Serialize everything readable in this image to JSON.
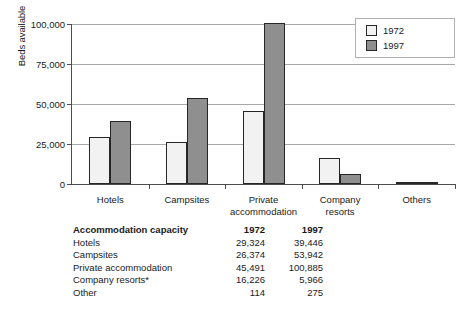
{
  "chart_data": {
    "type": "bar",
    "title": "",
    "xlabel": "",
    "ylabel": "Beds available",
    "ylim": [
      0,
      100000
    ],
    "yticks": [
      0,
      25000,
      50000,
      75000,
      100000
    ],
    "ytick_labels": [
      "0",
      "25,000",
      "50,000",
      "75,000",
      "100,000"
    ],
    "grid": true,
    "legend_position": "top-right",
    "categories": [
      "Hotels",
      "Campsites",
      "Private\naccommodation",
      "Company\nresorts",
      "Others"
    ],
    "series": [
      {
        "name": "1972",
        "color": "#f2f2f2",
        "values": [
          29324,
          26374,
          45491,
          16226,
          114
        ]
      },
      {
        "name": "1997",
        "color": "#8f8f8f",
        "values": [
          39446,
          53942,
          100885,
          5966,
          275
        ]
      }
    ]
  },
  "legend": {
    "items": [
      {
        "label": "1972"
      },
      {
        "label": "1997"
      }
    ]
  },
  "table": {
    "headers": [
      "Accommodation capacity",
      "1972",
      "1997"
    ],
    "rows": [
      {
        "label": "Hotels",
        "y1972": "29,324",
        "y1997": "39,446"
      },
      {
        "label": "Campsites",
        "y1972": "26,374",
        "y1997": "53,942"
      },
      {
        "label": "Private accommodation",
        "y1972": "45,491",
        "y1997": "100,885"
      },
      {
        "label": "Company resorts*",
        "y1972": "16,226",
        "y1997": "5,966"
      },
      {
        "label": "Other",
        "y1972": "114",
        "y1997": "275"
      }
    ]
  }
}
